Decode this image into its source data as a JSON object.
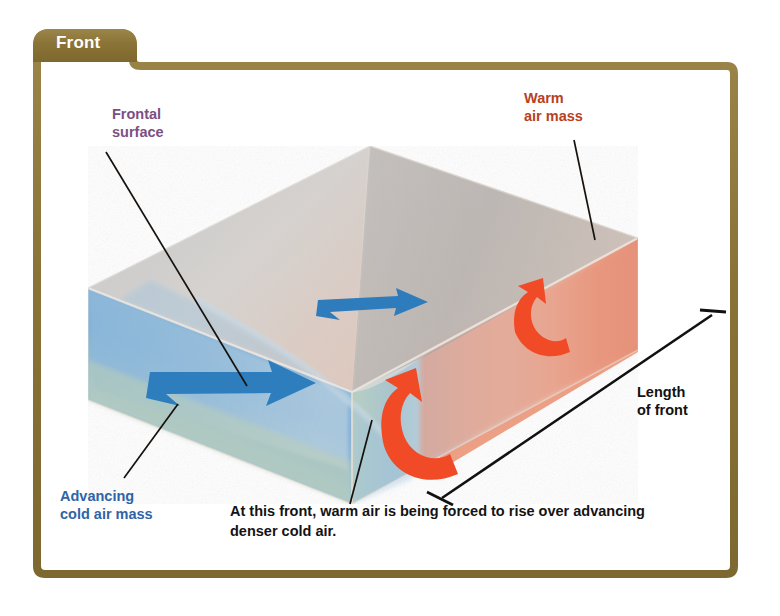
{
  "figure": {
    "tab_title": "Front",
    "frame_color": "#8c7638",
    "background": "#ffffff"
  },
  "labels": {
    "frontal_surface": "Frontal\nsurface",
    "warm_air_mass": "Warm\nair mass",
    "advancing_cold_air_mass": "Advancing\ncold air mass",
    "length_of_front": "Length\nof front"
  },
  "caption": {
    "text": "At this front, warm air is being forced to rise over advancing denser cold air."
  },
  "colors": {
    "frontal_surface_label": "#7c4f84",
    "warm_label": "#b7411f",
    "cold_label": "#2f64a6",
    "warm_air_fill": "#e8947a",
    "cold_air_fill": "#7fb0d8",
    "top_surface": "#b9b2aa",
    "warm_arrow": "#ef4423",
    "cold_arrow": "#2e7ebd",
    "leader_line": "#17120e"
  },
  "diagram": {
    "type": "3d-block-diagram",
    "elements": [
      "top-surface",
      "warm-air-mass-wedge",
      "cold-air-mass-wedge",
      "frontal-surface",
      "cold-air-arrow-front",
      "cold-air-arrow-back",
      "warm-air-rising-arrow-front",
      "warm-air-rising-arrow-back",
      "length-of-front-dimension"
    ]
  }
}
